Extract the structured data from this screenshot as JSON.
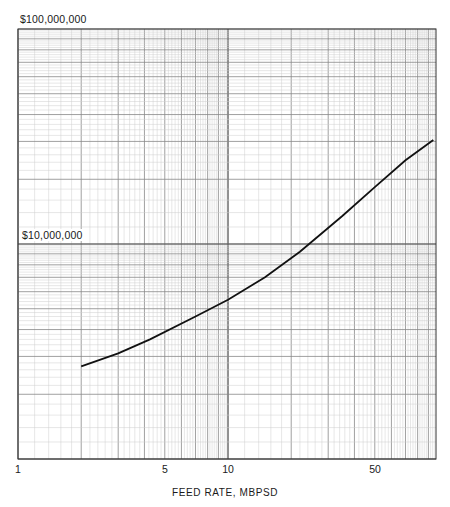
{
  "chart_data": {
    "type": "line",
    "title": "",
    "xlabel": "FEED RATE, MBPSD",
    "ylabel": "",
    "x_scale": "log",
    "y_scale": "log",
    "xlim": [
      1,
      95
    ],
    "ylim": [
      1000000,
      100000000
    ],
    "grid": true,
    "x_tick_labels": [
      {
        "value": 1,
        "label": "1"
      },
      {
        "value": 5,
        "label": "5"
      },
      {
        "value": 10,
        "label": "10"
      },
      {
        "value": 50,
        "label": "50"
      }
    ],
    "y_tick_labels": [
      {
        "value": 100000000,
        "label": "$100,000,000"
      },
      {
        "value": 10000000,
        "label": "$10,000,000"
      }
    ],
    "series": [
      {
        "name": "Cost vs feed rate",
        "x": [
          2,
          3,
          4.25,
          7,
          10,
          15,
          22,
          35,
          50,
          70,
          95
        ],
        "y": [
          2700000,
          3100000,
          3600000,
          4600000,
          5500000,
          7000000,
          9200000,
          13500000,
          18400000,
          24500000,
          30500000
        ]
      }
    ]
  },
  "labels": {
    "y_top": "$100,000,000",
    "y_mid": "$10,000,000",
    "x1": "1",
    "x5": "5",
    "x10": "10",
    "x50": "50",
    "x_axis_title": "FEED RATE, MBPSD"
  }
}
